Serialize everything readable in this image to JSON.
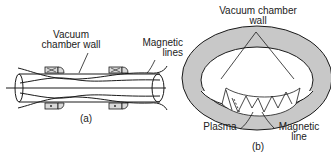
{
  "figure_a": {
    "label_wall_line1": "Vacuum",
    "label_wall_line2": "chamber wall",
    "label_lines_line1": "Magnetic",
    "label_lines_line2": "lines",
    "caption": "(a)"
  },
  "figure_b": {
    "label_wall_line1": "Vacuum chamber",
    "label_wall_line2": "wall",
    "label_plasma": "Plasma",
    "label_line_line1": "Magnetic",
    "label_line_line2": "line",
    "caption": "(b)"
  },
  "colors": {
    "stroke": "#1a1a1a",
    "torus_fill": "#c8c8c8",
    "coil_fill": "#d9d9d9"
  }
}
